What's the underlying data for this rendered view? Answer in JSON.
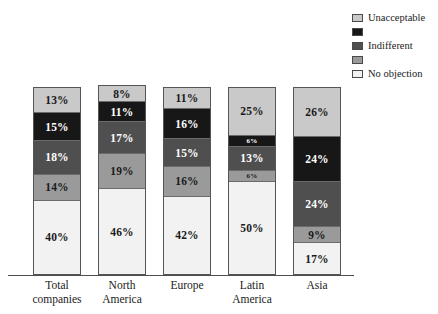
{
  "chart_data": {
    "type": "bar",
    "title": "",
    "subtitle": "",
    "xlabel": "",
    "ylabel": "",
    "ylim": [
      0,
      100
    ],
    "grid": false,
    "stacked": true,
    "stack_order": "top-to-bottom",
    "units": "percent",
    "legend_position": "top-right",
    "categories": [
      "Total companies",
      "North America",
      "Europe",
      "Latin America",
      "Asia"
    ],
    "category_lines": [
      [
        "Total",
        "companies"
      ],
      [
        "North",
        "America"
      ],
      [
        "Europe"
      ],
      [
        "Latin",
        "America"
      ],
      [
        "Asia"
      ]
    ],
    "series": [
      {
        "name": "Unacceptable",
        "color": "#c9c9c9",
        "label_color": "#1a1a1a",
        "values": [
          13,
          8,
          11,
          25,
          26
        ]
      },
      {
        "name": "",
        "color": "#171717",
        "label_color": "#ffffff",
        "values": [
          15,
          11,
          16,
          6,
          24
        ]
      },
      {
        "name": "Indifferent",
        "color": "#4f4f4f",
        "label_color": "#ffffff",
        "values": [
          18,
          17,
          15,
          13,
          24
        ]
      },
      {
        "name": "",
        "color": "#9a9a9a",
        "label_color": "#1a1a1a",
        "values": [
          14,
          19,
          16,
          6,
          9
        ]
      },
      {
        "name": "No objection",
        "color": "#f2f2f2",
        "label_color": "#1a1a1a",
        "values": [
          40,
          46,
          42,
          50,
          17
        ]
      }
    ],
    "bar_labels": [
      [
        "13%",
        "15%",
        "18%",
        "14%",
        "40%"
      ],
      [
        "8%",
        "11%",
        "17%",
        "19%",
        "46%"
      ],
      [
        "11%",
        "16%",
        "15%",
        "16%",
        "42%"
      ],
      [
        "25%",
        "6%",
        "13%",
        "6%",
        "50%"
      ],
      [
        "26%",
        "24%",
        "24%",
        "9%",
        "17%"
      ]
    ]
  },
  "legend": {
    "items": [
      {
        "label": "Unacceptable",
        "color": "#c9c9c9"
      },
      {
        "label": "",
        "color": "#171717"
      },
      {
        "label": "Indifferent",
        "color": "#4f4f4f"
      },
      {
        "label": "",
        "color": "#9a9a9a"
      },
      {
        "label": "No objection",
        "color": "#f2f2f2"
      }
    ]
  }
}
